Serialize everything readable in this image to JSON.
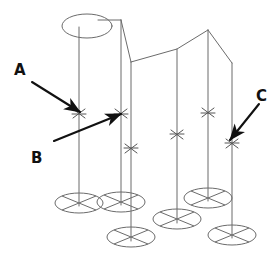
{
  "diagram": {
    "type": "technical-line-drawing",
    "title": "",
    "background_color": "#ffffff",
    "line_color": "#6b6b6b",
    "annotation_color": "#111111",
    "canvas": {
      "width": 280,
      "height": 258
    },
    "labels": [
      {
        "id": "A",
        "text": "A",
        "x": 14,
        "y": 75,
        "points_to": "left-front-pole-joint"
      },
      {
        "id": "B",
        "text": "B",
        "x": 31,
        "y": 163,
        "points_to": "second-pole-joint"
      },
      {
        "id": "C",
        "text": "C",
        "x": 256,
        "y": 101,
        "points_to": "right-rear-pole-joint"
      }
    ],
    "arrows": [
      {
        "id": "arrow-a",
        "from_x": 32,
        "from_y": 82,
        "to_x": 83,
        "to_y": 114
      },
      {
        "id": "arrow-b",
        "from_x": 54,
        "from_y": 141,
        "to_x": 124,
        "to_y": 113
      },
      {
        "id": "arrow-c",
        "from_x": 259,
        "from_y": 104,
        "to_x": 227,
        "to_y": 142
      }
    ],
    "top_ellipse": {
      "cx": 87,
      "cy": 26,
      "rx": 25,
      "ry": 12
    },
    "poles": [
      {
        "id": "pole-1",
        "top_x": 79,
        "top_y": 27,
        "bottom_x": 79,
        "bottom_y": 205,
        "cross_y": 113,
        "base": {
          "cx": 79,
          "cy": 203,
          "rx": 24,
          "ry": 10
        }
      },
      {
        "id": "pole-2",
        "top_x": 121,
        "top_y": 28,
        "bottom_x": 121,
        "bottom_y": 205,
        "cross_y": 114,
        "base": {
          "cx": 121,
          "cy": 202,
          "rx": 24,
          "ry": 10
        }
      },
      {
        "id": "pole-3",
        "top_x": 131,
        "top_y": 62,
        "bottom_x": 131,
        "bottom_y": 240,
        "cross_y": 148,
        "base": {
          "cx": 131,
          "cy": 238,
          "rx": 24,
          "ry": 10
        }
      },
      {
        "id": "pole-4",
        "top_x": 177,
        "top_y": 49,
        "bottom_x": 177,
        "bottom_y": 222,
        "cross_y": 134,
        "base": {
          "cx": 177,
          "cy": 220,
          "rx": 24,
          "ry": 10
        }
      },
      {
        "id": "pole-5",
        "top_x": 208,
        "top_y": 30,
        "bottom_x": 208,
        "bottom_y": 205,
        "cross_y": 113,
        "base": {
          "cx": 208,
          "cy": 199,
          "rx": 24,
          "ry": 10
        }
      },
      {
        "id": "pole-6",
        "top_x": 232,
        "top_y": 63,
        "bottom_x": 232,
        "bottom_y": 240,
        "cross_y": 143,
        "base": {
          "cx": 232,
          "cy": 236,
          "rx": 24,
          "ry": 10
        }
      }
    ],
    "canopy_path": "M 87 26 L 121 27 L 131 62 L 177 49 L 208 30 L 232 63",
    "ridge_segments": [
      {
        "from": "top-ellipse",
        "to": "pole-2-top"
      },
      {
        "from": "pole-2-top",
        "to": "pole-3-top"
      },
      {
        "from": "pole-3-top",
        "to": "pole-4-top"
      },
      {
        "from": "pole-4-top",
        "to": "pole-5-top"
      },
      {
        "from": "pole-5-top",
        "to": "pole-6-top"
      }
    ]
  }
}
